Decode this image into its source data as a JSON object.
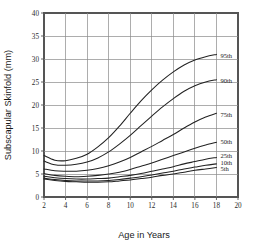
{
  "chart_data": {
    "type": "line",
    "title": "",
    "xlabel": "Age in Years",
    "ylabel": "Subscapular Skinfold (mm)",
    "xlim": [
      2,
      20
    ],
    "ylim": [
      0,
      40
    ],
    "xticks": [
      2,
      4,
      6,
      8,
      10,
      12,
      14,
      16,
      18,
      20
    ],
    "yticks": [
      0,
      5,
      10,
      15,
      20,
      25,
      30,
      35,
      40
    ],
    "xtick_labels": [
      "2",
      "4",
      "6",
      "8",
      "10",
      "12",
      "14",
      "16",
      "18",
      "20"
    ],
    "ytick_labels": [
      "0",
      "5",
      "10",
      "15",
      "20",
      "25",
      "30",
      "35",
      "40"
    ],
    "grid": true,
    "legend_position": "right-inline-labels",
    "x": [
      2,
      3,
      4,
      5,
      6,
      7,
      8,
      9,
      10,
      11,
      12,
      13,
      14,
      15,
      16,
      17,
      18
    ],
    "series": [
      {
        "name": "95th",
        "label": "95th",
        "values": [
          9.0,
          8.0,
          7.9,
          8.4,
          9.3,
          10.9,
          12.9,
          15.4,
          18.2,
          20.9,
          23.3,
          25.4,
          27.2,
          28.7,
          29.8,
          30.5,
          31.0
        ],
        "label_y": 30.8
      },
      {
        "name": "90th",
        "label": "90th",
        "values": [
          7.8,
          7.0,
          6.9,
          7.1,
          7.6,
          8.5,
          9.8,
          11.5,
          13.4,
          15.5,
          17.6,
          19.6,
          21.4,
          23.0,
          24.2,
          25.0,
          25.5
        ],
        "label_y": 25.2
      },
      {
        "name": "75th",
        "label": "75th",
        "values": [
          6.1,
          5.7,
          5.6,
          5.6,
          5.8,
          6.2,
          6.8,
          7.6,
          8.6,
          9.8,
          11.0,
          12.3,
          13.6,
          15.0,
          16.3,
          17.4,
          18.2
        ],
        "label_y": 17.9
      },
      {
        "name": "50th",
        "label": "50th",
        "values": [
          5.1,
          4.7,
          4.5,
          4.4,
          4.5,
          4.7,
          5.0,
          5.4,
          6.0,
          6.7,
          7.4,
          8.2,
          9.0,
          9.8,
          10.6,
          11.3,
          11.9
        ],
        "label_y": 12.0
      },
      {
        "name": "25th",
        "label": "25th",
        "values": [
          4.5,
          4.2,
          4.0,
          3.9,
          3.9,
          4.0,
          4.1,
          4.4,
          4.7,
          5.1,
          5.6,
          6.1,
          6.6,
          7.2,
          7.7,
          8.2,
          8.6
        ],
        "label_y": 8.9
      },
      {
        "name": "10th",
        "label": "10th",
        "values": [
          4.1,
          3.8,
          3.6,
          3.5,
          3.5,
          3.5,
          3.6,
          3.8,
          4.1,
          4.4,
          4.8,
          5.2,
          5.6,
          6.1,
          6.5,
          6.9,
          7.2
        ],
        "label_y": 7.4
      },
      {
        "name": "5th",
        "label": "5th",
        "values": [
          3.9,
          3.6,
          3.4,
          3.3,
          3.2,
          3.2,
          3.3,
          3.5,
          3.7,
          4.0,
          4.3,
          4.7,
          5.0,
          5.4,
          5.8,
          6.1,
          6.4
        ],
        "label_y": 6.1
      }
    ]
  }
}
